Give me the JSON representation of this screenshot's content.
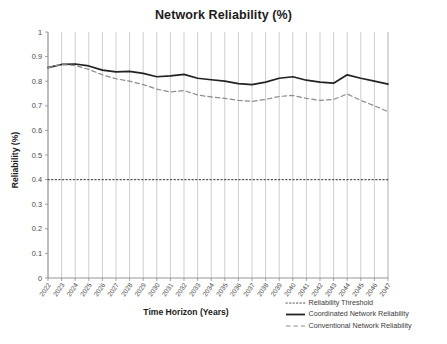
{
  "chart_data": {
    "type": "line",
    "title": "Network Reliability (%)",
    "xlabel": "Time Horizon (Years)",
    "ylabel": "Reliability (%)",
    "ylim": [
      0,
      1
    ],
    "yticks": [
      "0",
      "0.1",
      "0.2",
      "0.3",
      "0.4",
      "0.5",
      "0.6",
      "0.7",
      "0.8",
      "0.9",
      "1"
    ],
    "ytick_values": [
      0,
      0.1,
      0.2,
      0.3,
      0.4,
      0.5,
      0.6,
      0.7,
      0.8,
      0.9,
      1
    ],
    "grid": "vertical",
    "legend_position": "bottom-right",
    "categories": [
      "2022",
      "2023",
      "2024",
      "2025",
      "2026",
      "2027",
      "2028",
      "2029",
      "2030",
      "2031",
      "2032",
      "2033",
      "2034",
      "2035",
      "2036",
      "2037",
      "2038",
      "2039",
      "2040",
      "2041",
      "2042",
      "2043",
      "2044",
      "2045",
      "2046",
      "2047"
    ],
    "series": [
      {
        "name": "Coordinated Network Reliability",
        "style": "solid",
        "color": "#222222",
        "values": [
          0.855,
          0.868,
          0.87,
          0.862,
          0.845,
          0.838,
          0.84,
          0.832,
          0.818,
          0.822,
          0.828,
          0.812,
          0.806,
          0.8,
          0.79,
          0.786,
          0.796,
          0.812,
          0.818,
          0.804,
          0.796,
          0.792,
          0.826,
          0.812,
          0.8,
          0.788
        ]
      },
      {
        "name": "Conventional Network Reliability",
        "style": "dashed",
        "color": "#8c8c8c",
        "values": [
          0.855,
          0.868,
          0.864,
          0.848,
          0.826,
          0.81,
          0.8,
          0.786,
          0.768,
          0.756,
          0.762,
          0.744,
          0.736,
          0.73,
          0.722,
          0.718,
          0.726,
          0.738,
          0.742,
          0.73,
          0.722,
          0.726,
          0.748,
          0.722,
          0.7,
          0.676
        ]
      }
    ],
    "threshold": {
      "name": "Reliability Threshold",
      "style": "dotted",
      "color": "#555555",
      "value": 0.4
    },
    "legend": [
      {
        "label": "Reliability Threshold",
        "style": "dotted",
        "color": "#555555"
      },
      {
        "label": "Coordinated Network Reliability",
        "style": "solid",
        "color": "#222222"
      },
      {
        "label": "Conventional Network Reliability",
        "style": "dashed",
        "color": "#8c8c8c"
      }
    ]
  }
}
